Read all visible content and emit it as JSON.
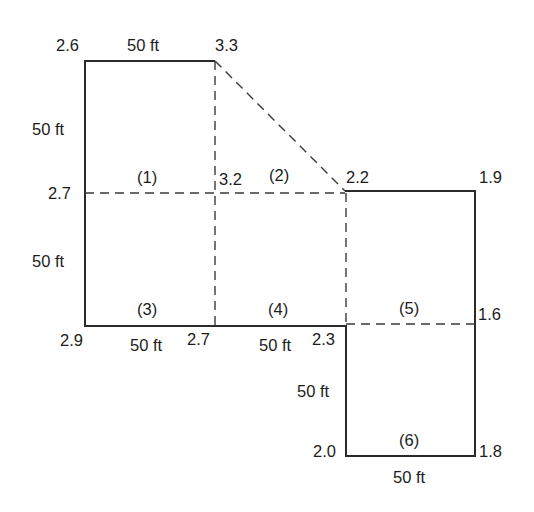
{
  "corner_elevations": {
    "top_left": "2.6",
    "top_diag_start": "3.3",
    "mid_left": "2.7",
    "mid_center": "3.2",
    "mid_right_notch": "2.2",
    "mid_far_right": "1.9",
    "bottom_left": "2.9",
    "bottom_center": "2.7",
    "bottom_notch": "2.3",
    "right_mid": "1.6",
    "lower_left": "2.0",
    "lower_right": "1.8"
  },
  "cells": {
    "c1": "(1)",
    "c2": "(2)",
    "c3": "(3)",
    "c4": "(4)",
    "c5": "(5)",
    "c6": "(6)"
  },
  "dimensions": {
    "top_width": "50 ft",
    "left_upper_height": "50 ft",
    "left_lower_height": "50 ft",
    "bottom_width_1": "50 ft",
    "bottom_width_2": "50 ft",
    "lower_height": "50 ft",
    "lower_width": "50 ft"
  }
}
